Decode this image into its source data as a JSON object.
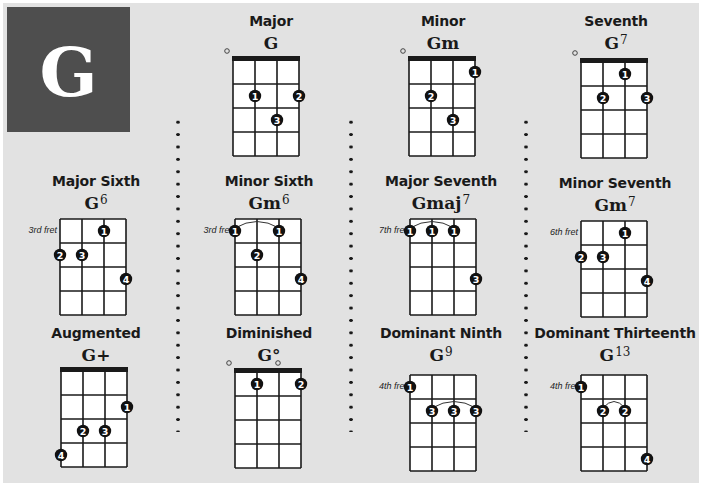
{
  "key": "G",
  "instrument": "ukulele",
  "colors": {
    "page_bg": "#e2e2e2",
    "key_block_bg": "#4e4e4e",
    "key_letter": "#ffffff",
    "grid_line": "#1a1a1a",
    "finger_dot": "#111111",
    "grid_fill": "#ffffff"
  },
  "chords": [
    {
      "id": "major",
      "title": "Major",
      "name": "G",
      "sup": "",
      "nut": true,
      "fret_label": "",
      "open": [
        0
      ],
      "fingers": [
        {
          "string": 2,
          "fret": 2,
          "label": "1"
        },
        {
          "string": 4,
          "fret": 2,
          "label": "2"
        },
        {
          "string": 3,
          "fret": 3,
          "label": "3"
        }
      ],
      "barres": []
    },
    {
      "id": "minor",
      "title": "Minor",
      "name": "Gm",
      "sup": "",
      "nut": true,
      "fret_label": "",
      "open": [
        0
      ],
      "fingers": [
        {
          "string": 4,
          "fret": 1,
          "label": "1"
        },
        {
          "string": 2,
          "fret": 2,
          "label": "2"
        },
        {
          "string": 3,
          "fret": 3,
          "label": "3"
        }
      ],
      "barres": []
    },
    {
      "id": "seventh",
      "title": "Seventh",
      "name": "G",
      "sup": "7",
      "nut": true,
      "fret_label": "",
      "open": [
        0
      ],
      "fingers": [
        {
          "string": 3,
          "fret": 1,
          "label": "1"
        },
        {
          "string": 2,
          "fret": 2,
          "label": "2"
        },
        {
          "string": 4,
          "fret": 2,
          "label": "3"
        }
      ],
      "barres": []
    },
    {
      "id": "major-sixth",
      "title": "Major Sixth",
      "name": "G",
      "sup": "6",
      "nut": false,
      "fret_label": "3rd fret",
      "open": [],
      "fingers": [
        {
          "string": 3,
          "fret": 1,
          "label": "1"
        },
        {
          "string": 1,
          "fret": 2,
          "label": "2"
        },
        {
          "string": 2,
          "fret": 2,
          "label": "3"
        },
        {
          "string": 4,
          "fret": 3,
          "label": "4"
        }
      ],
      "barres": []
    },
    {
      "id": "minor-sixth",
      "title": "Minor Sixth",
      "name": "Gm",
      "sup": "6",
      "nut": false,
      "fret_label": "3rd fret",
      "open": [],
      "fingers": [
        {
          "string": 1,
          "fret": 1,
          "label": "1"
        },
        {
          "string": 3,
          "fret": 1,
          "label": "1"
        },
        {
          "string": 2,
          "fret": 2,
          "label": "2"
        },
        {
          "string": 4,
          "fret": 3,
          "label": "4"
        }
      ],
      "barres": [
        {
          "fret": 1,
          "from": 1,
          "to": 3
        }
      ]
    },
    {
      "id": "major-seventh",
      "title": "Major Seventh",
      "name": "Gmaj",
      "sup": "7",
      "nut": false,
      "fret_label": "7th fret",
      "open": [],
      "fingers": [
        {
          "string": 1,
          "fret": 1,
          "label": "1"
        },
        {
          "string": 2,
          "fret": 1,
          "label": "1"
        },
        {
          "string": 3,
          "fret": 1,
          "label": "1"
        },
        {
          "string": 4,
          "fret": 3,
          "label": "3"
        }
      ],
      "barres": [
        {
          "fret": 1,
          "from": 1,
          "to": 3
        }
      ]
    },
    {
      "id": "minor-seventh",
      "title": "Minor Seventh",
      "name": "Gm",
      "sup": "7",
      "nut": false,
      "fret_label": "6th fret",
      "open": [],
      "fingers": [
        {
          "string": 3,
          "fret": 1,
          "label": "1"
        },
        {
          "string": 1,
          "fret": 2,
          "label": "2"
        },
        {
          "string": 2,
          "fret": 2,
          "label": "3"
        },
        {
          "string": 4,
          "fret": 3,
          "label": "4"
        }
      ],
      "barres": []
    },
    {
      "id": "augmented",
      "title": "Augmented",
      "name": "G+",
      "sup": "",
      "nut": true,
      "fret_label": "",
      "open": [],
      "fingers": [
        {
          "string": 4,
          "fret": 2,
          "label": "1"
        },
        {
          "string": 2,
          "fret": 3,
          "label": "2"
        },
        {
          "string": 3,
          "fret": 3,
          "label": "3"
        },
        {
          "string": 1,
          "fret": 4,
          "label": "4"
        }
      ],
      "barres": []
    },
    {
      "id": "diminished",
      "title": "Diminished",
      "name": "G°",
      "sup": "",
      "nut": true,
      "fret_label": "",
      "open": [
        0,
        2
      ],
      "fingers": [
        {
          "string": 2,
          "fret": 1,
          "label": "1"
        },
        {
          "string": 4,
          "fret": 1,
          "label": "2"
        }
      ],
      "barres": []
    },
    {
      "id": "dominant-ninth",
      "title": "Dominant Ninth",
      "name": "G",
      "sup": "9",
      "nut": false,
      "fret_label": "4th fret",
      "open": [],
      "fingers": [
        {
          "string": 1,
          "fret": 1,
          "label": "1"
        },
        {
          "string": 2,
          "fret": 2,
          "label": "3"
        },
        {
          "string": 3,
          "fret": 2,
          "label": "3"
        },
        {
          "string": 4,
          "fret": 2,
          "label": "3"
        }
      ],
      "barres": [
        {
          "fret": 2,
          "from": 2,
          "to": 4
        }
      ]
    },
    {
      "id": "dominant-thirteenth",
      "title": "Dominant Thirteenth",
      "name": "G",
      "sup": "13",
      "nut": false,
      "fret_label": "4th fret",
      "open": [],
      "fingers": [
        {
          "string": 1,
          "fret": 1,
          "label": "1"
        },
        {
          "string": 2,
          "fret": 2,
          "label": "2"
        },
        {
          "string": 3,
          "fret": 2,
          "label": "2"
        },
        {
          "string": 4,
          "fret": 4,
          "label": "4"
        }
      ],
      "barres": [
        {
          "fret": 2,
          "from": 2,
          "to": 3
        }
      ]
    }
  ]
}
